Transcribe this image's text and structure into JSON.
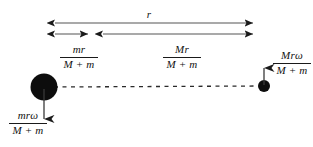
{
  "figure": {
    "background_color": "#ffffff",
    "stroke_color": "#1a1a1a",
    "body_fill_color": "#0d0d0d"
  },
  "labels": {
    "total_separation": {
      "id": "r",
      "text": "r",
      "kind": "simple",
      "meaning": "total separation between the two masses"
    },
    "small_mass_radius": {
      "id": "mr/(M+m)",
      "numerator": "mr",
      "denominator": "M + m",
      "kind": "fraction",
      "meaning": "orbital radius of mass M from the centre of mass"
    },
    "large_mass_radius": {
      "id": "Mr/(M+m)",
      "numerator": "Mr",
      "denominator": "M + m",
      "kind": "fraction",
      "meaning": "orbital radius of mass m from the centre of mass"
    },
    "small_body_velocity": {
      "id": "Mrω/(M+m)",
      "numerator": "Mrω",
      "denominator": "M + m",
      "kind": "fraction",
      "meaning": "tangential speed of the small body, arrow points up"
    },
    "large_body_velocity": {
      "id": "mrω/(M+m)",
      "numerator": "mrω",
      "denominator": "M + m",
      "kind": "fraction",
      "meaning": "tangential speed of the large body, arrow points down"
    }
  },
  "geometry": {
    "large_body": {
      "cx": 44,
      "cy": 87,
      "r": 13.5
    },
    "small_body": {
      "cx": 264,
      "cy": 86,
      "r": 6
    },
    "centre_of_mass_x": 95,
    "axis_line": {
      "x1": 52,
      "y1": 87,
      "x2": 262,
      "y2": 86
    },
    "dimension_r": {
      "x1": 46,
      "x2": 262,
      "y": 23
    },
    "dimension_split": {
      "x1": 46,
      "xm": 95,
      "x2": 262,
      "y": 34
    },
    "velocity_arrow_large": {
      "x": 44,
      "y1": 90,
      "y2": 129
    },
    "velocity_arrow_small": {
      "x": 264,
      "y1": 84,
      "y2": 57
    }
  }
}
